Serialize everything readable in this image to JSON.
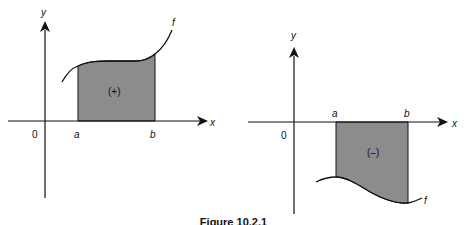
{
  "figure": {
    "caption": "Figure 10.2.1",
    "left_panel": {
      "x_axis_label": "x",
      "y_axis_label": "y",
      "origin_label": "0",
      "lower_bound_label": "a",
      "upper_bound_label": "b",
      "function_label": "f",
      "region_sign_label": "(+)",
      "region_fill": "#8c8c8c"
    },
    "right_panel": {
      "x_axis_label": "x",
      "y_axis_label": "y",
      "origin_label": "0",
      "lower_bound_label": "a",
      "upper_bound_label": "b",
      "function_label": "f",
      "region_sign_label": "(–)",
      "region_fill": "#8c8c8c"
    }
  }
}
